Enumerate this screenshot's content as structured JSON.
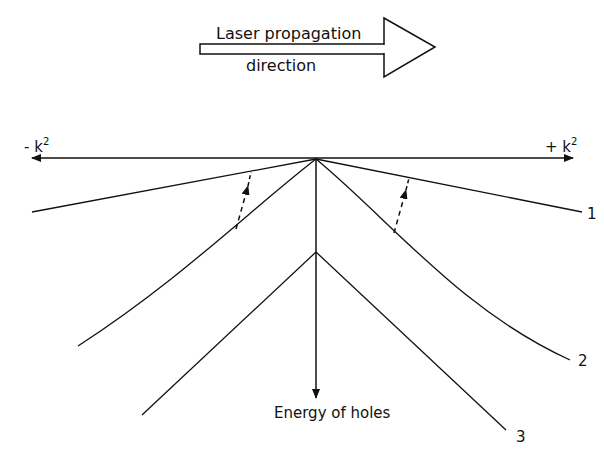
{
  "diagram": {
    "laser_arrow": {
      "label_line1": "Laser propagation",
      "label_line2": "direction"
    },
    "k_axis": {
      "left_label": "- k",
      "left_sup": "2",
      "right_label": "+ k",
      "right_sup": "2"
    },
    "energy_axis": {
      "label": "Energy of holes"
    },
    "bands": [
      {
        "id": "1",
        "label": "1"
      },
      {
        "id": "2",
        "label": "2"
      },
      {
        "id": "3",
        "label": "3"
      }
    ],
    "transitions": [
      {
        "side": "left",
        "style": "dashed-arrow-up"
      },
      {
        "side": "right",
        "style": "dashed-arrow-up"
      }
    ],
    "colors": {
      "line": "#111111",
      "background": "#ffffff"
    }
  }
}
